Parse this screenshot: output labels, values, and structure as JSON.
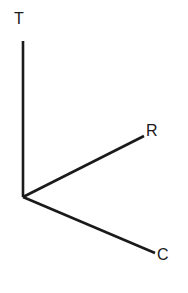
{
  "figure": {
    "name": "three-axis-vector-diagram",
    "background_color": "#ffffff",
    "line_color": "#1a1a1a",
    "line_width": 2.6,
    "width": 188,
    "height": 293
  },
  "origin": {
    "x": 23,
    "y": 197
  },
  "axes": [
    {
      "id": "T",
      "label": "T",
      "label_x": 14,
      "label_y": 11,
      "from": {
        "x": 23,
        "y": 197
      },
      "to": {
        "x": 23,
        "y": 41
      },
      "direction": "up",
      "path": "M 23 197 L 23 41"
    },
    {
      "id": "R",
      "label": "R",
      "label_x": 146,
      "label_y": 123,
      "from": {
        "x": 23,
        "y": 197
      },
      "to": {
        "x": 144,
        "y": 136
      },
      "direction": "upper-right",
      "path": "M 23 197 L 144 136"
    },
    {
      "id": "C",
      "label": "C",
      "label_x": 157,
      "label_y": 247,
      "from": {
        "x": 23,
        "y": 197
      },
      "to": {
        "x": 155,
        "y": 253
      },
      "direction": "lower-right",
      "path": "M 23 197 L 155 253"
    }
  ]
}
